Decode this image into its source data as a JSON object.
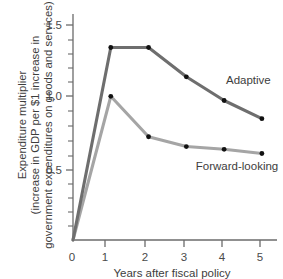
{
  "chart_data": {
    "type": "line",
    "title": "",
    "xlabel": "Years after fiscal policy",
    "ylabel": "Expenditure multiplier (increase in GDP per $1 increase in government expenditures on goods and services)",
    "ylabel_lines": [
      "Expenditure multiplier",
      "(increase in GDP per $1 increase in",
      "government expenditures on goods and services)"
    ],
    "x": [
      0,
      1,
      2,
      3,
      4,
      5
    ],
    "xlim": [
      0,
      5.4
    ],
    "ylim": [
      0,
      1.62
    ],
    "xticks": [
      0,
      1,
      2,
      3,
      4,
      5
    ],
    "xtick_labels": [
      "0",
      "1",
      "2",
      "3",
      "4",
      "5"
    ],
    "yticks": [
      0.5,
      1.0,
      1.5
    ],
    "ytick_labels": [
      "0.5",
      "1.0",
      "1.5"
    ],
    "yminor_ticks": [
      0.1,
      0.2,
      0.3,
      0.4,
      0.6,
      0.7,
      0.8,
      0.9,
      1.1,
      1.2,
      1.3,
      1.4
    ],
    "grid": false,
    "legend_position": "inline-annotation",
    "series": [
      {
        "name": "Adaptive",
        "color": "#6e6e6e",
        "marker_color": "#111111",
        "values": [
          0,
          1.38,
          1.38,
          1.17,
          1.0,
          0.87
        ],
        "annotation": "Adaptive",
        "annotation_x": 4.05,
        "annotation_y": 1.12
      },
      {
        "name": "Forward-looking",
        "color": "#a5a5a5",
        "marker_color": "#111111",
        "values": [
          0,
          1.03,
          0.74,
          0.67,
          0.65,
          0.62
        ],
        "annotation": "Forward-looking",
        "annotation_x": 3.25,
        "annotation_y": 0.5
      }
    ]
  },
  "colors": {
    "adaptive": "#6e6e6e",
    "forward_looking": "#a5a5a5",
    "axis": "#6b6b6b",
    "text": "#3d3d3d",
    "background": "#ffffff"
  }
}
